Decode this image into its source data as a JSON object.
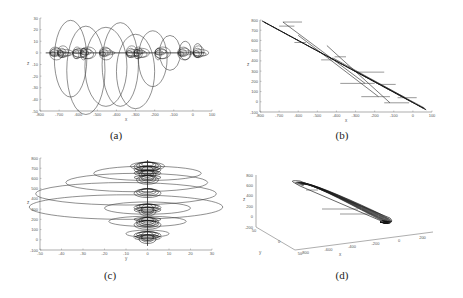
{
  "figure": {
    "captions": [
      "(a)",
      "(b)",
      "(c)",
      "(d)"
    ]
  },
  "chart_data": [
    {
      "id": "a",
      "type": "line",
      "caption": "(a)",
      "title": "",
      "xlabel": "x",
      "ylabel": "z",
      "xlim": [
        -800,
        100
      ],
      "ylim": [
        -50,
        30
      ],
      "xticks": [
        -800,
        -700,
        -600,
        -500,
        -400,
        -300,
        -200,
        -100,
        0,
        100
      ],
      "yticks": [
        30,
        20,
        10,
        0,
        -10,
        -20,
        -30,
        -40,
        -50
      ],
      "grid": false,
      "description": "Projection of a looping trajectory onto x-z plane; series of large loops descending to about -47 and rising to about 28 around a band near 0",
      "loops": [
        {
          "cx": -640,
          "cy": -5,
          "rx": 85,
          "ry": 33
        },
        {
          "cx": -560,
          "cy": -15,
          "rx": 100,
          "ry": 38
        },
        {
          "cx": -455,
          "cy": -12,
          "rx": 110,
          "ry": 34
        },
        {
          "cx": -380,
          "cy": -10,
          "rx": 95,
          "ry": 36
        },
        {
          "cx": -300,
          "cy": -16,
          "rx": 100,
          "ry": 32
        },
        {
          "cx": -210,
          "cy": -5,
          "rx": 75,
          "ry": 24
        },
        {
          "cx": -120,
          "cy": 0,
          "rx": 55,
          "ry": 15
        },
        {
          "cx": -40,
          "cy": 2,
          "rx": 30,
          "ry": 8
        },
        {
          "cx": 25,
          "cy": 2,
          "rx": 22,
          "ry": 6
        }
      ]
    },
    {
      "id": "b",
      "type": "line",
      "caption": "(b)",
      "title": "",
      "xlabel": "x",
      "ylabel": "z",
      "xlim": [
        -800,
        100
      ],
      "ylim": [
        -100,
        800
      ],
      "xticks": [
        -800,
        -700,
        -600,
        -500,
        -400,
        -300,
        -200,
        -100,
        0,
        100
      ],
      "yticks": [
        800,
        700,
        600,
        500,
        400,
        300,
        200,
        100,
        0,
        -100
      ],
      "grid": false,
      "description": "Projection onto x-z plane: trajectory descends diagonally from (-780, 780) to (70, -80) with horizontal jump segments",
      "segments": [
        [
          [
            -780,
            780
          ],
          [
            70,
            -80
          ]
        ],
        [
          [
            -680,
            780
          ],
          [
            -250,
            180
          ]
        ],
        [
          [
            -600,
            650
          ],
          [
            -180,
            50
          ]
        ],
        [
          [
            -450,
            550
          ],
          [
            -120,
            -10
          ]
        ],
        [
          [
            -420,
            430
          ],
          [
            -40,
            40
          ]
        ],
        [
          [
            -300,
            300
          ],
          [
            60,
            -60
          ]
        ]
      ],
      "horizontals": [
        [
          -680,
          780,
          -580
        ],
        [
          -700,
          740,
          -620
        ],
        [
          -620,
          580,
          -560
        ],
        [
          -480,
          410,
          -420
        ],
        [
          -410,
          440,
          -350
        ],
        [
          -380,
          180,
          -200
        ],
        [
          -290,
          290,
          -150
        ],
        [
          -270,
          50,
          -120
        ],
        [
          -180,
          170,
          -90
        ],
        [
          -150,
          -10,
          -20
        ],
        [
          -80,
          40,
          20
        ]
      ]
    },
    {
      "id": "c",
      "type": "line",
      "caption": "(c)",
      "title": "",
      "xlabel": "y",
      "ylabel": "z",
      "xlim": [
        -50,
        30
      ],
      "ylim": [
        -100,
        800
      ],
      "xticks": [
        -50,
        -40,
        -30,
        -20,
        -10,
        0,
        10,
        20,
        30
      ],
      "yticks": [
        800,
        700,
        600,
        500,
        400,
        300,
        200,
        100,
        0,
        -100
      ],
      "grid": false,
      "description": "Projection onto y-z plane: stacked ellipses centered at y=0 at decreasing heights",
      "loops": [
        {
          "cx": 0,
          "cy": 720,
          "rx": 8,
          "ry": 40
        },
        {
          "cx": 0,
          "cy": 650,
          "rx": 25,
          "ry": 70
        },
        {
          "cx": -5,
          "cy": 560,
          "rx": 33,
          "ry": 90
        },
        {
          "cx": -10,
          "cy": 450,
          "rx": 42,
          "ry": 110
        },
        {
          "cx": -10,
          "cy": 320,
          "rx": 45,
          "ry": 120
        },
        {
          "cx": 0,
          "cy": 310,
          "rx": 20,
          "ry": 60
        },
        {
          "cx": 0,
          "cy": 180,
          "rx": 18,
          "ry": 50
        },
        {
          "cx": 0,
          "cy": 60,
          "rx": 10,
          "ry": 35
        }
      ]
    },
    {
      "id": "d",
      "type": "line",
      "caption": "(d)",
      "title": "",
      "xlabel": "x",
      "ylabel": "z",
      "zlabel": "y",
      "projection": "3d",
      "xticks": [
        -800,
        -600,
        -400,
        -200,
        0,
        200
      ],
      "yticks": [
        50,
        0,
        -50
      ],
      "zticks": [
        800,
        600,
        400,
        200,
        0,
        -200
      ],
      "grid": false,
      "description": "3D trajectory forming a thin elongated loop from upper-left to lower-right"
    }
  ]
}
